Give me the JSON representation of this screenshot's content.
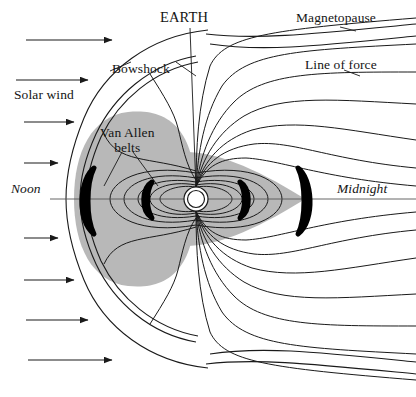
{
  "figure": {
    "width": 416,
    "height": 397,
    "background_color": "#ffffff",
    "line_color": "#1a1a1a",
    "plasma_fill_color": "#b8b8b8",
    "belt_fill_color": "#000000",
    "earth_fill_color": "#ffffff"
  },
  "labels": {
    "earth": "EARTH",
    "magnetopause": "Magnetopause",
    "line_of_force": "Line of force",
    "bowshock": "Bowshock",
    "solar_wind": "Solar wind",
    "van_allen_line1": "Van Allen",
    "van_allen_line2": "belts",
    "noon": "Noon",
    "midnight": "Midnight"
  },
  "features": {
    "earth": {
      "center_x": 196,
      "center_y": 199,
      "outer_radius": 12,
      "inner_radius": 9
    },
    "solar_wind_arrow_count": 8,
    "van_allen_belt_count": 4,
    "field_line_count": 20,
    "axis_label_left": "Noon",
    "axis_label_right": "Midnight"
  }
}
